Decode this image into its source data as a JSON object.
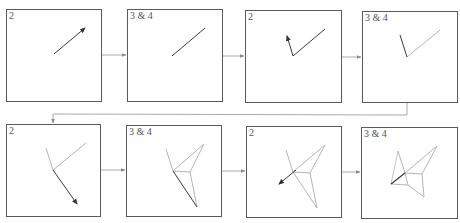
{
  "diagram": {
    "colors": {
      "panel_border": "#5a5a5a",
      "connector": "#9a9a9a",
      "active_stroke": "#3a3a3a",
      "previous_stroke": "#b0b0b0",
      "label": "#555555"
    },
    "panels": [
      {
        "id": 1,
        "row": 1,
        "label": "2",
        "content": "single dark arrow pointing up-right"
      },
      {
        "id": 2,
        "row": 1,
        "label": "3 & 4",
        "content": "dark line up-right (arrow drawn as line)"
      },
      {
        "id": 3,
        "row": 1,
        "label": "2",
        "content": "previous line plus new dark arrow pointing up-left"
      },
      {
        "id": 4,
        "row": 1,
        "label": "3 & 4",
        "content": "grey previous line, dark short line up-left"
      },
      {
        "id": 5,
        "row": 2,
        "label": "2",
        "content": "grey V-shape plus new dark arrow pointing down-right"
      },
      {
        "id": 6,
        "row": 2,
        "label": "3 & 4",
        "content": "kite-shaped figure with dark edge down-right"
      },
      {
        "id": 7,
        "row": 2,
        "label": "2",
        "content": "kite figure plus dark arrow pointing down-left"
      },
      {
        "id": 8,
        "row": 2,
        "label": "3 & 4",
        "content": "crane-like folded figure with dark edge lower-left"
      }
    ],
    "connectors": [
      {
        "from": 1,
        "to": 2,
        "direction": "right"
      },
      {
        "from": 2,
        "to": 3,
        "direction": "right"
      },
      {
        "from": 3,
        "to": 4,
        "direction": "right"
      },
      {
        "from": 4,
        "to": 5,
        "direction": "wrap-down-left"
      },
      {
        "from": 5,
        "to": 6,
        "direction": "right"
      },
      {
        "from": 6,
        "to": 7,
        "direction": "right"
      },
      {
        "from": 7,
        "to": 8,
        "direction": "right"
      }
    ]
  }
}
